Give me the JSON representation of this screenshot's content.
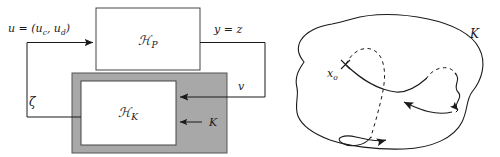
{
  "figure": {
    "background_color": "#ffffff",
    "ink_color": "#1a1a1a",
    "gray_fill": "#a8a8a8",
    "panels": [
      {
        "id": "block-diagram",
        "name": "hybrid-feedback-block-diagram",
        "blocks": [
          {
            "id": "plant",
            "label": "ℋ",
            "subscript": "P",
            "fill": "#ffffff"
          },
          {
            "id": "controller",
            "label": "ℋ",
            "subscript": "K",
            "fill": "#ffffff"
          },
          {
            "id": "controller-wrapper",
            "label": "K",
            "fill": "#a8a8a8"
          }
        ],
        "signals": [
          {
            "id": "input",
            "label": "u = (u",
            "sub1": "c",
            "mid": ", u",
            "sub2": "d",
            "close": ")"
          },
          {
            "id": "output",
            "label": "y = z"
          },
          {
            "id": "measurement",
            "label": "v"
          },
          {
            "id": "feedback",
            "label": "ζ"
          },
          {
            "id": "controller-pointer",
            "label": "K"
          }
        ]
      },
      {
        "id": "state-space-sketch",
        "name": "invariant-set-trajectory-sketch",
        "labels": [
          {
            "id": "set",
            "label": "K"
          },
          {
            "id": "initial-state",
            "label": "x",
            "subscript": "o"
          }
        ],
        "marker": "x-cross",
        "flow_style": "solid",
        "jump_style": "dashed"
      }
    ]
  }
}
